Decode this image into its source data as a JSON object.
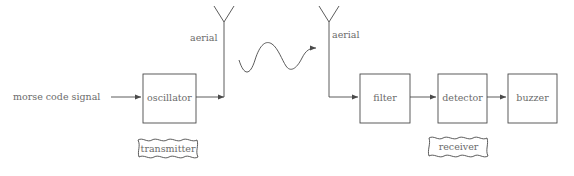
{
  "diagram": {
    "stroke_color": "#4a4a4a",
    "text_color": "#6b6b6b",
    "background_color": "#ffffff"
  },
  "input_label": "morse code signal",
  "blocks": [
    {
      "id": "oscillator",
      "label": "oscillator"
    },
    {
      "id": "filter",
      "label": "filter"
    },
    {
      "id": "detector",
      "label": "detector"
    },
    {
      "id": "buzzer",
      "label": "buzzer"
    }
  ],
  "aerials": [
    {
      "id": "transmit-aerial",
      "label": "aerial"
    },
    {
      "id": "receive-aerial",
      "label": "aerial"
    }
  ],
  "group_labels": [
    {
      "id": "transmitter",
      "label": "transmitter"
    },
    {
      "id": "receiver",
      "label": "receiver"
    }
  ],
  "radio_wave": {
    "name": "radio-wave",
    "cycles": 1.5,
    "direction": "left-to-right"
  }
}
